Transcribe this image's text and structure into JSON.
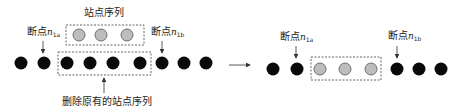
{
  "colors": {
    "node": "#0a0a0a",
    "station": "#bdbdbd",
    "station_stroke": "#555555",
    "dash": "#666666",
    "arrow": "#333333"
  },
  "left": {
    "station_seq_label": "站点序列",
    "delete_label": "删除原有的站点序列",
    "bp_a": {
      "prefix": "断点",
      "var": "n",
      "sub": "1a"
    },
    "bp_b": {
      "prefix": "断点",
      "var": "n",
      "sub": "1b"
    },
    "nodes_x": [
      21,
      44,
      67,
      90,
      113,
      140,
      162,
      184,
      206
    ],
    "node_y": 63,
    "new_stations_x": [
      79,
      101,
      127
    ],
    "new_station_y": 35
  },
  "right": {
    "bp_a": {
      "prefix": "断点",
      "var": "n",
      "sub": "1a"
    },
    "bp_b": {
      "prefix": "断点",
      "var": "n",
      "sub": "1b"
    },
    "nodes_x": [
      273,
      297,
      397,
      419,
      441
    ],
    "stations_x": [
      320,
      345,
      371
    ],
    "node_y": 69
  }
}
